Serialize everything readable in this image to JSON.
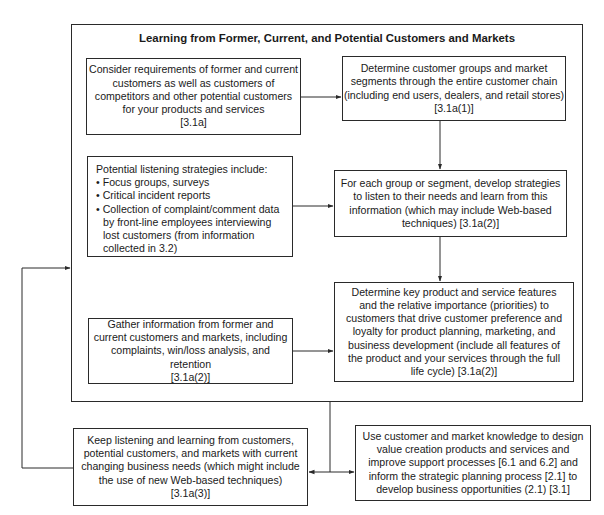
{
  "diagram": {
    "title": "Learning from Former, Current, and Potential Customers and Markets",
    "nodes": {
      "consider_requirements": {
        "lines": [
          "Consider requirements of former and current",
          "customers as well as customers of",
          "competitors and other potential customers",
          "for your products and services",
          "[3.1a]"
        ]
      },
      "determine_groups": {
        "lines": [
          "Determine customer groups and market",
          "segments through the entire customer chain",
          "(including end users, dealers, and retail stores)",
          "[3.1a(1)]"
        ]
      },
      "listening_strategies": {
        "heading": "Potential listening strategies include:",
        "bullets": [
          "Focus groups, surveys",
          "Critical incident reports",
          "Collection of complaint/comment data by front-line employees interviewing lost customers (from information collected in 3.2)"
        ]
      },
      "develop_strategies": {
        "lines": [
          "For each group or segment, develop strategies",
          "to listen to their needs and learn from this",
          "information (which may include Web-based",
          "techniques) [3.1a(2)]"
        ]
      },
      "gather_information": {
        "lines": [
          "Gather information from former and",
          "current customers and markets, including",
          "complaints, win/loss analysis, and retention",
          "[3.1a(2)]"
        ]
      },
      "determine_features": {
        "lines": [
          "Determine key product and service features",
          "and the relative importance (priorities) to",
          "customers that drive customer preference and",
          "loyalty for product planning, marketing, and",
          "business development (include all features of",
          "the product and your services through the full",
          "life cycle) [3.1a(2)]"
        ]
      },
      "keep_listening": {
        "lines": [
          "Keep listening and learning from customers,",
          "potential customers, and markets with current",
          "changing business needs (which might include",
          "the use of new Web-based techniques)",
          "[3.1a(3)]"
        ]
      },
      "use_knowledge": {
        "lines": [
          "Use customer and market knowledge to design",
          "value creation products and services and",
          "improve support processes [6.1 and 6.2] and",
          "inform the strategic planning process [2.1] to",
          "develop business opportunities (2.1) [3.1]"
        ]
      }
    },
    "edges": [
      {
        "from": "consider_requirements",
        "to": "determine_groups"
      },
      {
        "from": "determine_groups",
        "to": "develop_strategies"
      },
      {
        "from": "listening_strategies",
        "to": "develop_strategies"
      },
      {
        "from": "develop_strategies",
        "to": "determine_features"
      },
      {
        "from": "gather_information",
        "to": "determine_features"
      },
      {
        "from": "outer_frame",
        "to": "keep_listening"
      },
      {
        "from": "outer_frame",
        "to": "use_knowledge"
      },
      {
        "from": "keep_listening",
        "to": "outer_frame"
      }
    ],
    "colors": {
      "stroke": "#2a2a2a",
      "text": "#1a1a1a",
      "background": "#ffffff"
    }
  }
}
